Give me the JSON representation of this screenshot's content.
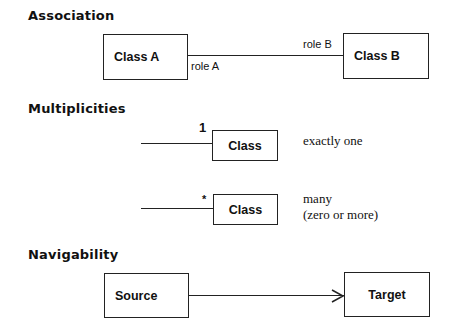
{
  "sections": {
    "association": {
      "heading": "Association",
      "class_a": "Class A",
      "class_b": "Class B",
      "role_a": "role A",
      "role_b": "role B"
    },
    "multiplicities": {
      "heading": "Multiplicities",
      "rows": [
        {
          "multiplicity": "1",
          "class": "Class",
          "description_line1": "exactly one",
          "description_line2": ""
        },
        {
          "multiplicity": "*",
          "class": "Class",
          "description_line1": "many",
          "description_line2": "(zero or more)"
        }
      ]
    },
    "navigability": {
      "heading": "Navigability",
      "source": "Source",
      "target": "Target",
      "arrow": "open-arrow"
    }
  }
}
